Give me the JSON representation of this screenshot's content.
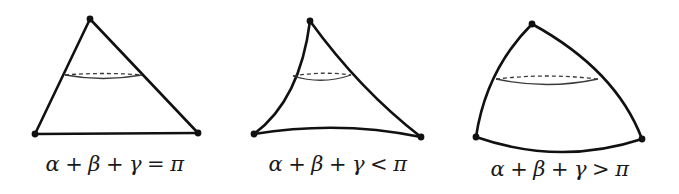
{
  "figure": {
    "colors": {
      "stroke": "#111111",
      "ring": "#3a3a3a",
      "background": "#ffffff"
    },
    "panels": [
      {
        "geometry": "euclidean",
        "curvature": "flat",
        "vertices": [
          [
            90,
            19
          ],
          [
            35,
            134
          ],
          [
            198,
            133
          ]
        ],
        "ring": {
          "left": [
            65,
            75
          ],
          "right": [
            142,
            75
          ],
          "front_dip": 79,
          "back_rise": 73
        },
        "label": {
          "alpha": "α",
          "plus1": "+",
          "beta": "β",
          "plus2": "+",
          "gamma": "γ",
          "relation": "=",
          "pi": "π"
        },
        "label_text": "α + β + γ = π"
      },
      {
        "geometry": "hyperbolic",
        "curvature": "negative",
        "vertices": [
          [
            310,
            21
          ],
          [
            254,
            134
          ],
          [
            421,
            137
          ]
        ],
        "ring": {
          "left": [
            293,
            76
          ],
          "right": [
            351,
            75
          ],
          "front_dip": 80,
          "back_rise": 72
        },
        "label": {
          "alpha": "α",
          "plus1": "+",
          "beta": "β",
          "plus2": "+",
          "gamma": "γ",
          "relation": "<",
          "pi": "π"
        },
        "label_text": "α + β + γ < π"
      },
      {
        "geometry": "spherical",
        "curvature": "positive",
        "vertices": [
          [
            532,
            24
          ],
          [
            476,
            137
          ],
          [
            642,
            139
          ]
        ],
        "ring": {
          "left": [
            496,
            79
          ],
          "right": [
            598,
            79
          ],
          "front_dip": 85,
          "back_rise": 76
        },
        "label": {
          "alpha": "α",
          "plus1": "+",
          "beta": "β",
          "plus2": "+",
          "gamma": "γ",
          "relation": ">",
          "pi": "π"
        },
        "label_text": "α + β + γ > π"
      }
    ]
  }
}
